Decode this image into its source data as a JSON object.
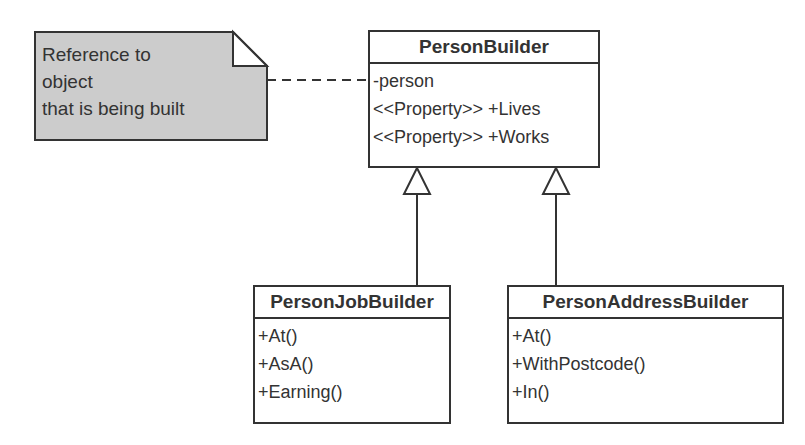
{
  "note": {
    "lines": [
      "Reference to",
      "object",
      "that is being built"
    ],
    "fill_color": "#cccccc"
  },
  "classes": {
    "person_builder": {
      "name": "PersonBuilder",
      "members": [
        "-person",
        "<<Property>> +Lives",
        "<<Property>> +Works"
      ]
    },
    "person_job_builder": {
      "name": "PersonJobBuilder",
      "members": [
        "+At()",
        "+AsA()",
        "+Earning()"
      ]
    },
    "person_address_builder": {
      "name": "PersonAddressBuilder",
      "members": [
        "+At()",
        "+WithPostcode()",
        "+In()"
      ]
    }
  },
  "relationships": [
    {
      "type": "note-anchor",
      "from": "note",
      "to": "PersonBuilder",
      "style": "dashed"
    },
    {
      "type": "generalization",
      "from": "PersonJobBuilder",
      "to": "PersonBuilder"
    },
    {
      "type": "generalization",
      "from": "PersonAddressBuilder",
      "to": "PersonBuilder"
    }
  ]
}
